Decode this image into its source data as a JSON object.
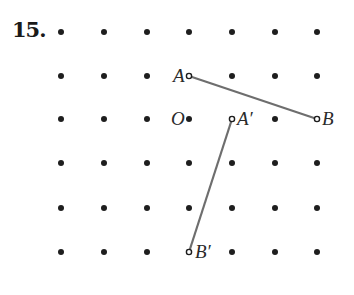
{
  "problem": {
    "number": "15."
  },
  "grid": {
    "columns_x": [
      61,
      104,
      147,
      189,
      232,
      275,
      317
    ],
    "rows_y": [
      32,
      76,
      119,
      163,
      208,
      252
    ],
    "dot_color": "#1e1e1e",
    "dot_radius": 3
  },
  "points": [
    {
      "id": "A",
      "label": "A",
      "col": 3,
      "row": 1,
      "label_dx": -16,
      "label_dy": 6
    },
    {
      "id": "B",
      "label": "B",
      "col": 6,
      "row": 2,
      "label_dx": 5,
      "label_dy": 6
    },
    {
      "id": "O",
      "label": "O",
      "col": 3,
      "row": 2,
      "label_dx": -18,
      "label_dy": 6
    },
    {
      "id": "A_prime",
      "label": "A′",
      "col": 4,
      "row": 2,
      "label_dx": 5,
      "label_dy": 6
    },
    {
      "id": "B_prime",
      "label": "B′",
      "col": 3,
      "row": 5,
      "label_dx": 6,
      "label_dy": 6
    }
  ],
  "segments": [
    {
      "id": "AB",
      "from": "A",
      "to": "B",
      "label": "Segment AB"
    },
    {
      "id": "A_prime_B_prime",
      "from": "A_prime",
      "to": "B_prime",
      "label": "Segment A′B′"
    }
  ],
  "colors": {
    "segment": "#6e6e6e",
    "text": "#2a2a2a"
  }
}
